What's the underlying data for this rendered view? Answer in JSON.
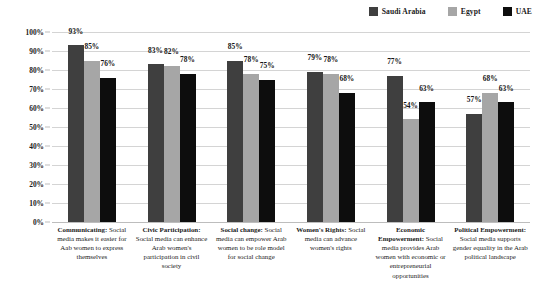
{
  "chart_data": {
    "type": "bar",
    "title": "",
    "xlabel": "",
    "ylabel": "",
    "ylim": [
      0,
      100
    ],
    "ytick_labels": [
      "100%",
      "90%",
      "80%",
      "70%",
      "60%",
      "50%",
      "40%",
      "30%",
      "20%",
      "10%",
      "0%"
    ],
    "ytick_values": [
      100,
      90,
      80,
      70,
      60,
      50,
      40,
      30,
      20,
      10,
      0
    ],
    "grid": true,
    "legend_position": "top-right",
    "value_suffix": "%",
    "categories": [
      "Communicating: Social media makes it easier for Aab women to express themselves",
      "Civic Participation: Social media can enhance Arab women's participation in civil society",
      "Social change: Social media can empower Arab women to be role model for social change",
      "Women's Rights: Social media can advance women's rights",
      "Economic Empowerment: Social media provides Arab women with economic or entrepreneurial opportunities",
      "Political Empowerment: Social media supports gender equality in the Arab political landscape"
    ],
    "category_parts": [
      {
        "heading": "Communicating:",
        "body": " Social media makes it easier for Aab women to express themselves"
      },
      {
        "heading": "Civic Participation:",
        "body": " Social media can enhance Arab women's participation in civil society"
      },
      {
        "heading": "Social change:",
        "body": " Social media can empower Arab women to be role model for social change"
      },
      {
        "heading": "Women's Rights:",
        "body": " Social media can advance women's rights"
      },
      {
        "heading": "Economic Empowerment:",
        "body": " Social media provides Arab women with economic or entrepreneurial opportunities"
      },
      {
        "heading": "Political Empowerment:",
        "body": " Social media supports gender equality in the Arab political landscape"
      }
    ],
    "series": [
      {
        "name": "Saudi Arabia",
        "color": "#3F3F3F",
        "values": [
          93,
          83,
          85,
          79,
          77,
          57
        ],
        "labels": [
          "93%",
          "83%",
          "85%",
          "79%",
          "77%",
          "57%"
        ]
      },
      {
        "name": "Egypt",
        "color": "#A6A6A6",
        "values": [
          85,
          82,
          78,
          78,
          54,
          68
        ],
        "labels": [
          "85%",
          "82%",
          "78%",
          "78%",
          "54%",
          "68%"
        ]
      },
      {
        "name": "UAE",
        "color": "#0D0D0D",
        "values": [
          76,
          78,
          75,
          68,
          63,
          63
        ],
        "labels": [
          "76%",
          "78%",
          "75%",
          "68%",
          "63%",
          "63%"
        ]
      }
    ]
  },
  "legend": {
    "items": [
      {
        "label": "Saudi Arabia",
        "color": "#3F3F3F"
      },
      {
        "label": "Egypt",
        "color": "#A6A6A6"
      },
      {
        "label": "UAE",
        "color": "#0D0D0D"
      }
    ]
  }
}
